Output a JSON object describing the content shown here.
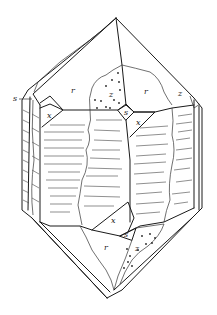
{
  "diagram": {
    "type": "crystal-drawing",
    "face_labels": [
      {
        "id": "s_top_left",
        "text": "s",
        "x": 13,
        "y": 101
      },
      {
        "id": "r_top_left",
        "text": "r",
        "x": 71,
        "y": 93
      },
      {
        "id": "z_top_center",
        "text": "z",
        "x": 109,
        "y": 97
      },
      {
        "id": "r_top_right",
        "text": "r",
        "x": 144,
        "y": 94
      },
      {
        "id": "z_top_right",
        "text": "z",
        "x": 178,
        "y": 96
      },
      {
        "id": "x_top_left",
        "text": "x",
        "x": 47,
        "y": 118
      },
      {
        "id": "s_top_center",
        "text": "s",
        "x": 126,
        "y": 113
      },
      {
        "id": "x_top_right",
        "text": "x",
        "x": 136,
        "y": 125
      },
      {
        "id": "x_bottom",
        "text": "x",
        "x": 111,
        "y": 223
      },
      {
        "id": "s_bottom",
        "text": "s",
        "x": 126,
        "y": 235
      },
      {
        "id": "r_bottom",
        "text": "r",
        "x": 104,
        "y": 250
      },
      {
        "id": "z_bottom",
        "text": "z",
        "x": 135,
        "y": 251
      }
    ],
    "stippled_faces": [
      "z_top_center",
      "z_bottom"
    ],
    "striated_faces": [
      "prism faces m"
    ]
  }
}
